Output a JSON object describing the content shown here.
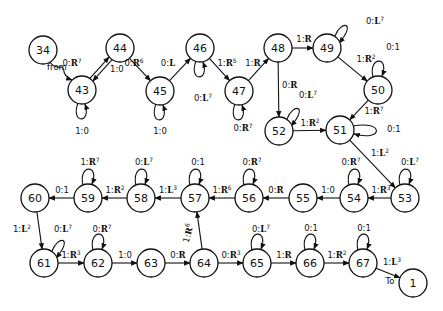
{
  "diagram": {
    "type": "state-transition-diagram",
    "nodes": [
      {
        "id": "34",
        "x": 43,
        "y": 50
      },
      {
        "id": "43",
        "x": 82,
        "y": 90
      },
      {
        "id": "44",
        "x": 120,
        "y": 48
      },
      {
        "id": "45",
        "x": 160,
        "y": 91
      },
      {
        "id": "46",
        "x": 200,
        "y": 48
      },
      {
        "id": "47",
        "x": 239,
        "y": 91
      },
      {
        "id": "48",
        "x": 278,
        "y": 48
      },
      {
        "id": "49",
        "x": 327,
        "y": 48
      },
      {
        "id": "50",
        "x": 378,
        "y": 90
      },
      {
        "id": "51",
        "x": 340,
        "y": 130
      },
      {
        "id": "52",
        "x": 279,
        "y": 131
      },
      {
        "id": "53",
        "x": 405,
        "y": 198
      },
      {
        "id": "54",
        "x": 354,
        "y": 198
      },
      {
        "id": "55",
        "x": 303,
        "y": 198
      },
      {
        "id": "56",
        "x": 249,
        "y": 198
      },
      {
        "id": "57",
        "x": 195,
        "y": 198
      },
      {
        "id": "58",
        "x": 141,
        "y": 198
      },
      {
        "id": "59",
        "x": 88,
        "y": 198
      },
      {
        "id": "60",
        "x": 35,
        "y": 198
      },
      {
        "id": "61",
        "x": 44,
        "y": 263
      },
      {
        "id": "62",
        "x": 98,
        "y": 263
      },
      {
        "id": "63",
        "x": 151,
        "y": 263
      },
      {
        "id": "64",
        "x": 204,
        "y": 263
      },
      {
        "id": "65",
        "x": 257,
        "y": 263
      },
      {
        "id": "66",
        "x": 310,
        "y": 263
      },
      {
        "id": "67",
        "x": 363,
        "y": 263
      },
      {
        "id": "1",
        "x": 413,
        "y": 283
      }
    ],
    "edges": [
      {
        "from": "34",
        "to": "43",
        "label": "from",
        "kind": "squiggle"
      },
      {
        "from": "43",
        "to": "44",
        "read": "0",
        "move": "R",
        "exp": "7"
      },
      {
        "from": "44",
        "to": "43",
        "read": "1",
        "move": "0",
        "exp": ""
      },
      {
        "from": "43",
        "to": "43",
        "read": "1",
        "move": "0",
        "exp": "",
        "loop": "below"
      },
      {
        "from": "44",
        "to": "45",
        "read": "0",
        "move": "R",
        "exp": "6"
      },
      {
        "from": "45",
        "to": "45",
        "read": "1",
        "move": "0",
        "exp": "",
        "loop": "below"
      },
      {
        "from": "45",
        "to": "46",
        "read": "0",
        "move": "L",
        "exp": ""
      },
      {
        "from": "46",
        "to": "46",
        "read": "0",
        "move": "L",
        "exp": "7",
        "loop": "below"
      },
      {
        "from": "46",
        "to": "47",
        "read": "1",
        "move": "R",
        "exp": "5"
      },
      {
        "from": "47",
        "to": "47",
        "read": "0",
        "move": "R",
        "exp": "7",
        "loop": "below"
      },
      {
        "from": "47",
        "to": "48",
        "read": "1",
        "move": "R",
        "exp": ""
      },
      {
        "from": "48",
        "to": "49",
        "read": "1",
        "move": "R",
        "exp": ""
      },
      {
        "from": "48",
        "to": "52",
        "read": "0",
        "move": "R",
        "exp": ""
      },
      {
        "from": "49",
        "to": "49",
        "read": "0",
        "move": "L",
        "exp": "7",
        "loop": "upper-right"
      },
      {
        "from": "49",
        "to": "50",
        "read": "1",
        "move": "R",
        "exp": "2"
      },
      {
        "from": "50",
        "to": "50",
        "read": "0",
        "move": "1",
        "exp": "",
        "loop": "above"
      },
      {
        "from": "50",
        "to": "51",
        "read": "1",
        "move": "R",
        "exp": "7"
      },
      {
        "from": "52",
        "to": "52",
        "read": "0",
        "move": "L",
        "exp": "7",
        "loop": "upper-right"
      },
      {
        "from": "52",
        "to": "51",
        "read": "1",
        "move": "R",
        "exp": "2"
      },
      {
        "from": "51",
        "to": "51",
        "read": "0",
        "move": "1",
        "exp": "",
        "loop": "right"
      },
      {
        "from": "51",
        "to": "53",
        "read": "1",
        "move": "L",
        "exp": "2"
      },
      {
        "from": "53",
        "to": "53",
        "read": "0",
        "move": "L",
        "exp": "7",
        "loop": "above"
      },
      {
        "from": "53",
        "to": "54",
        "read": "1",
        "move": "R",
        "exp": "3"
      },
      {
        "from": "54",
        "to": "54",
        "read": "0",
        "move": "R",
        "exp": "7",
        "loop": "above"
      },
      {
        "from": "54",
        "to": "55",
        "read": "1",
        "move": "0",
        "exp": ""
      },
      {
        "from": "55",
        "to": "56",
        "read": "0",
        "move": "R",
        "exp": ""
      },
      {
        "from": "56",
        "to": "56",
        "read": "0",
        "move": "R",
        "exp": "7",
        "loop": "above"
      },
      {
        "from": "56",
        "to": "57",
        "read": "1",
        "move": "R",
        "exp": "6"
      },
      {
        "from": "57",
        "to": "57",
        "read": "0",
        "move": "1",
        "exp": "",
        "loop": "above"
      },
      {
        "from": "57",
        "to": "58",
        "read": "1",
        "move": "L",
        "exp": "3"
      },
      {
        "from": "58",
        "to": "58",
        "read": "0",
        "move": "L",
        "exp": "7",
        "loop": "above"
      },
      {
        "from": "58",
        "to": "59",
        "read": "1",
        "move": "R",
        "exp": "2"
      },
      {
        "from": "59",
        "to": "59",
        "read": "1",
        "move": "R",
        "exp": "7",
        "loop": "above"
      },
      {
        "from": "59",
        "to": "60",
        "read": "0",
        "move": "1",
        "exp": ""
      },
      {
        "from": "60",
        "to": "61",
        "read": "1",
        "move": "L",
        "exp": "2"
      },
      {
        "from": "61",
        "to": "61",
        "read": "0",
        "move": "L",
        "exp": "7",
        "loop": "upper-right"
      },
      {
        "from": "61",
        "to": "62",
        "read": "1",
        "move": "R",
        "exp": "3"
      },
      {
        "from": "62",
        "to": "62",
        "read": "0",
        "move": "R",
        "exp": "7",
        "loop": "above"
      },
      {
        "from": "62",
        "to": "63",
        "read": "1",
        "move": "0",
        "exp": ""
      },
      {
        "from": "63",
        "to": "64",
        "read": "0",
        "move": "R",
        "exp": ""
      },
      {
        "from": "64",
        "to": "57",
        "read": "1",
        "move": "R",
        "exp": "6"
      },
      {
        "from": "64",
        "to": "65",
        "read": "0",
        "move": "R",
        "exp": "3"
      },
      {
        "from": "65",
        "to": "65",
        "read": "0",
        "move": "L",
        "exp": "7",
        "loop": "above"
      },
      {
        "from": "65",
        "to": "66",
        "read": "1",
        "move": "R",
        "exp": ""
      },
      {
        "from": "66",
        "to": "66",
        "read": "0",
        "move": "1",
        "exp": "",
        "loop": "above"
      },
      {
        "from": "66",
        "to": "67",
        "read": "1",
        "move": "R",
        "exp": "2"
      },
      {
        "from": "67",
        "to": "67",
        "read": "0",
        "move": "1",
        "exp": "",
        "loop": "above"
      },
      {
        "from": "67",
        "to": "1",
        "read": "1",
        "move": "L",
        "exp": "3"
      }
    ],
    "annotations": {
      "from_label": "from",
      "to_label": "To"
    }
  }
}
